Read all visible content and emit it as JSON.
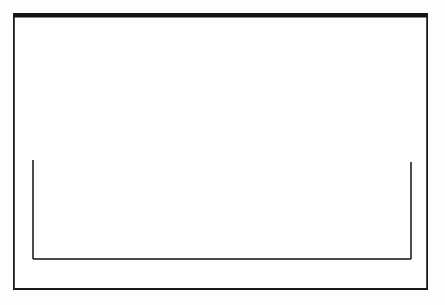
{
  "figure": {
    "type": "line-diagram",
    "background_color": "#fdfdfc",
    "ink_color": "#111111"
  },
  "frame": {
    "name": "outer-border",
    "x": 13,
    "y": 13,
    "width": 415,
    "height": 277,
    "stroke_color": "#141414",
    "top_stroke_width": 4.5,
    "side_stroke_width": 1.8,
    "bottom_stroke_width": 2.0,
    "fill": "#ffffff"
  },
  "chart_data": {
    "type": "area",
    "title": "",
    "subtitle": "",
    "xlabel": "",
    "ylabel": "",
    "grid": false,
    "legend": null,
    "axis_visible": {
      "baseline": true,
      "left_ordinate": true,
      "right_ordinate": true,
      "ticks": false,
      "tick_labels": false
    },
    "baseline": {
      "y_px": 259,
      "x_start_px": 33,
      "x_end_px": 411,
      "stroke_width": 1.6
    },
    "plot_box": {
      "left_px": 33,
      "right_px": 411,
      "baseline_px": 259,
      "peak_px": 52
    },
    "xlim": [
      33,
      411
    ],
    "ylim_px": [
      259,
      52
    ],
    "curve": {
      "name": "bell-curve",
      "smooth": true,
      "stroke_width": 1.7,
      "stroke_color": "#111111",
      "x": [
        33,
        41,
        50,
        59,
        68,
        77,
        86,
        95,
        104,
        113,
        122,
        131,
        140,
        150,
        159,
        168,
        177,
        186,
        195,
        204,
        213,
        222,
        231,
        240,
        249,
        258,
        267,
        276,
        285,
        294,
        303,
        312,
        321,
        330,
        339,
        348,
        357,
        366,
        375,
        384,
        393,
        402,
        411
      ],
      "y": [
        160,
        157,
        153,
        149,
        145,
        141,
        136,
        131,
        126,
        121,
        116,
        111,
        105,
        100,
        94,
        88,
        82,
        76,
        70,
        65,
        59,
        54,
        52,
        53,
        56,
        60,
        65,
        70,
        76,
        82,
        88,
        94,
        100,
        106,
        112,
        118,
        124,
        130,
        136,
        142,
        149,
        156,
        162
      ]
    },
    "strips": {
      "name": "vertical-strips",
      "count": 18,
      "spacing_px": 22.2,
      "stroke_width": 1.3,
      "stroke_color": "#1a1a1a",
      "x_positions": [
        33,
        55,
        77,
        100,
        122,
        144,
        166,
        188,
        211,
        233,
        255,
        277,
        299,
        322,
        344,
        366,
        388,
        411
      ],
      "tops_px": [
        160,
        142,
        128,
        114,
        101,
        88,
        73,
        61,
        53,
        54,
        64,
        75,
        87,
        100,
        113,
        127,
        144,
        162
      ]
    }
  },
  "annotations": {
    "labels": [],
    "tick_labels": [],
    "caption": ""
  }
}
